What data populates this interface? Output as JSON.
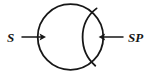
{
  "figure": {
    "background_color": "#ffffff",
    "stroke_color": "#171717",
    "width": 148,
    "height": 73
  },
  "labels": {
    "left": "S",
    "right": "SP"
  },
  "shapes": {
    "circle": {
      "name": "main-circle",
      "cx": 70.5,
      "cy": 37,
      "r": 32.8
    },
    "arc": {
      "name": "inner-arc",
      "start_x": 96.5,
      "start_y": 8.2,
      "end_x": 95.2,
      "end_y": 65.6,
      "apex_x": 84.0
    }
  },
  "arrows": {
    "left": {
      "name": "input-arrow",
      "direction": "right",
      "x_start": 22,
      "x_end": 45,
      "y": 37
    },
    "right": {
      "name": "output-arrow",
      "direction": "left",
      "x_start": 123,
      "x_end": 99,
      "y": 37
    }
  }
}
